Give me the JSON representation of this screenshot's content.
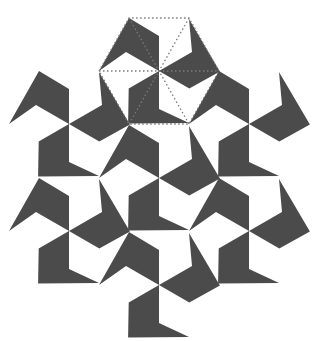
{
  "figure": {
    "width": 321,
    "height": 341,
    "background": "#ffffff",
    "tile_color": "#4b4b4b",
    "guide_color": "#7a7a7a",
    "hex_radius": 60,
    "hex_half_height": 53,
    "piece_notch_distance": 38,
    "piece_mid_distance": 35,
    "hexagon_centers": [
      [
        159,
        71
      ],
      [
        69,
        124
      ],
      [
        249,
        124
      ],
      [
        159,
        178
      ],
      [
        69,
        231
      ],
      [
        249,
        231
      ],
      [
        159,
        285
      ]
    ],
    "highlighted_hexagon_index": 0
  }
}
